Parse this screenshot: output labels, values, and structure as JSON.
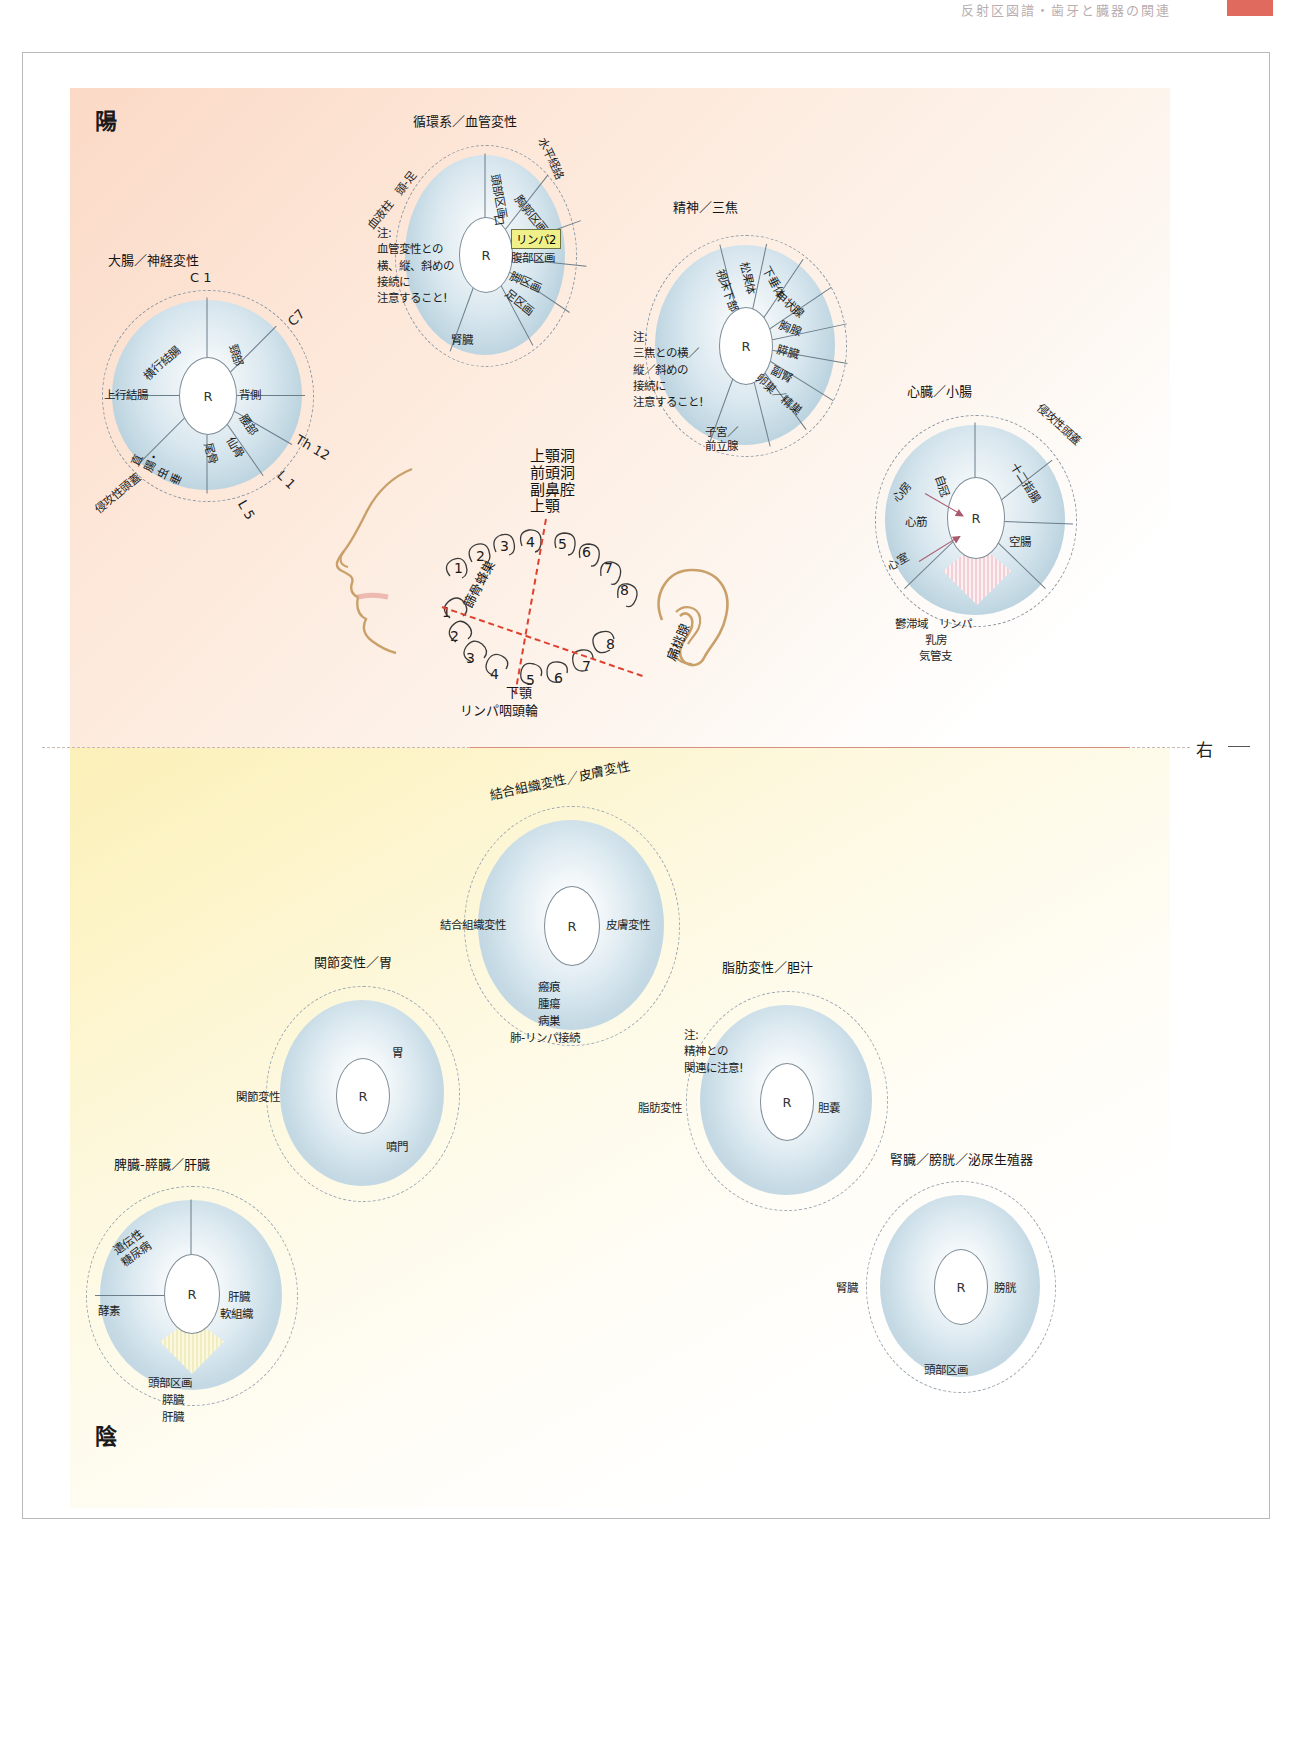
{
  "header": {
    "running_text": "反射区図譜・歯牙と臓器の関連"
  },
  "page": {
    "yang_label": "陽",
    "yin_label": "陰",
    "right_marker": "右"
  },
  "wheels_yang": [
    {
      "id": "large-intestine",
      "title": "大腸／神経変性",
      "hub": "R",
      "rim_top": "C 1",
      "rim_right_upper": "C7",
      "rim_right_lower": "Th 12",
      "rim_right_bottom": "L 1",
      "rim_bottom_right": "L 5",
      "rim_bottom_left": "侵攻性頭蓋",
      "segments": [
        "横行結腸",
        "頸部",
        "背側",
        "腰部",
        "仙骨",
        "尾骨",
        "直腸・虫垂",
        "上行結腸"
      ]
    },
    {
      "id": "circulatory",
      "title": "循環系／血管変性",
      "hub": "R",
      "rim_left": "血液柱　頭-足",
      "rim_right": "水平経絡",
      "note": "注:\n血管変性との\n横、縦、斜めの\n接続に\n注意すること!",
      "segments": [
        "頭部区画",
        "口",
        "胸郭区画",
        "腹部区画",
        "脚区画",
        "足区画",
        "腎臓"
      ],
      "highlight": "リンパ2"
    },
    {
      "id": "spirit-triple-burner",
      "title": "精神／三焦",
      "hub": "R",
      "note": "注:\n三焦との横／\n縦／斜めの\n接続に\n注意すること!",
      "segments": [
        "視床下部",
        "松果体",
        "下垂体",
        "甲状腺",
        "胸腺",
        "膵臓",
        "副腎",
        "卵巣／精巣"
      ],
      "bottom": "子宮／\n前立腺"
    },
    {
      "id": "heart-small-intestine",
      "title": "心臓／小腸",
      "hub": "R",
      "rim_right": "侵攻性頭蓋",
      "segments": [
        "自冠",
        "十二指腸",
        "空腸"
      ],
      "arrow_labels": [
        "心房",
        "心筋",
        "心室"
      ],
      "bottom_lines": [
        "鬱滞域　リンパ",
        "乳房",
        "気管支"
      ]
    }
  ],
  "dental": {
    "sinus_labels": [
      "上顎洞",
      "前頭洞",
      "副鼻腔",
      "上顎"
    ],
    "left_label": "篩骨蜂巣",
    "right_label": "扁桃腺",
    "bottom_labels": [
      "下顎",
      "リンパ咽頭輪"
    ],
    "upper_left_teeth": [
      "1",
      "2",
      "3",
      "4"
    ],
    "upper_right_teeth": [
      "5",
      "6",
      "7",
      "8"
    ],
    "lower_left_teeth": [
      "1",
      "2",
      "3",
      "4"
    ],
    "lower_right_teeth": [
      "5",
      "6",
      "7",
      "8"
    ]
  },
  "wheels_yin": [
    {
      "id": "connective-skin",
      "title": "結合組織変性／皮膚変性",
      "hub": "R",
      "left": "結合組織変性",
      "right": "皮膚変性",
      "bottom_lines": [
        "瘢痕",
        "腫瘍",
        "病巣",
        "肺-リンパ接続"
      ]
    },
    {
      "id": "joint-stomach",
      "title": "関節変性／胃",
      "hub": "R",
      "left": "関節変性",
      "right_upper": "胃",
      "right_lower": "噴門"
    },
    {
      "id": "fat-bile",
      "title": "脂肪変性／胆汁",
      "hub": "R",
      "left": "脂肪変性",
      "right": "胆嚢",
      "note": "注:\n精神との\n関連に注意!"
    },
    {
      "id": "kidney-bladder",
      "title": "腎臓／膀胱／泌尿生殖器",
      "hub": "R",
      "left": "腎臓",
      "right": "膀胱",
      "bottom": "頭部区画"
    },
    {
      "id": "spleen-pancreas-liver",
      "title": "脾臓-膵臓／肝臓",
      "hub": "R",
      "upper_left": "遺伝性\n糖尿病",
      "left": "酵素",
      "right_upper": "肝臓",
      "right_lower": "軟組織",
      "bottom_lines": [
        "頭部区画",
        "膵臓",
        "肝臓"
      ]
    }
  ],
  "colors": {
    "yang_tint": "#fbd9c6",
    "yin_tint": "#fbf0b8",
    "wheel_blue": "#bcd4e0",
    "highlight_yellow": "#eff08a",
    "accent_red": "#e0402e",
    "arrow_mauve": "#a85a6e"
  }
}
